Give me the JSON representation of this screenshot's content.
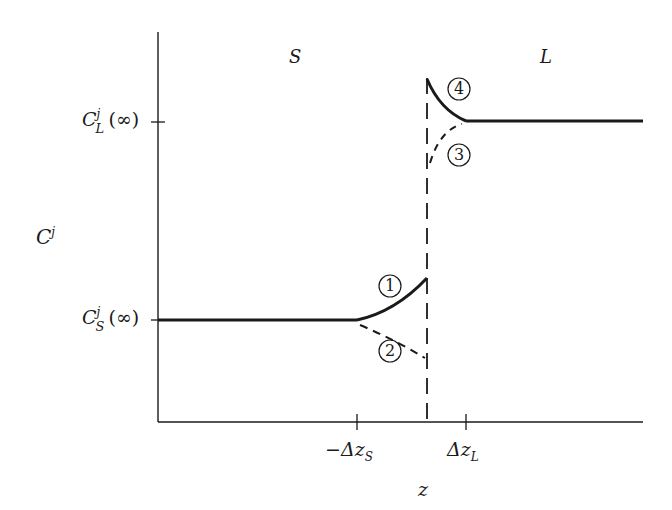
{
  "regions": {
    "solid": "S",
    "liquid": "L"
  },
  "y_axis": {
    "label_main": "C",
    "label_sup": "j",
    "ticks": [
      {
        "main": "C",
        "sup": "j",
        "sub": "L",
        "arg": "(∞)"
      },
      {
        "main": "C",
        "sup": "j",
        "sub": "S",
        "arg": "(∞)"
      }
    ]
  },
  "x_axis": {
    "label": "z",
    "ticks": [
      {
        "prefix": "−Δz",
        "sub": "S"
      },
      {
        "prefix": "Δz",
        "sub": "L"
      }
    ]
  },
  "curves": [
    {
      "id": "1",
      "label": "1",
      "style": "solid",
      "side": "S"
    },
    {
      "id": "2",
      "label": "2",
      "style": "dashed",
      "side": "S"
    },
    {
      "id": "3",
      "label": "3",
      "style": "dashed",
      "side": "L"
    },
    {
      "id": "4",
      "label": "4",
      "style": "solid",
      "side": "L"
    }
  ],
  "colors": {
    "ink": "#1a1a1a",
    "background": "#ffffff"
  }
}
